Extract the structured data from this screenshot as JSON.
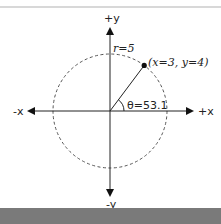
{
  "diagram": {
    "axes": {
      "pos_y": "+y",
      "neg_y": "-y",
      "pos_x": "+x",
      "neg_x": "-x"
    },
    "radius_label": "r=5",
    "point_label": "(x=3, y=4)",
    "angle_label": "θ=53.1",
    "point": {
      "x": 3,
      "y": 4
    },
    "radius": 5,
    "angle_deg": 53.1,
    "colors": {
      "stroke": "#222222",
      "circle": "#555555",
      "bottom_band": "#7a7a7a",
      "top_rule": "#d8d8d8"
    }
  }
}
